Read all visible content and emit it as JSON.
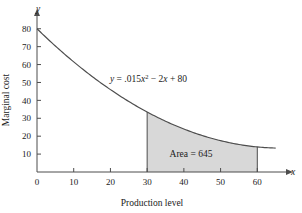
{
  "chart_data": {
    "type": "area",
    "title": "",
    "xlabel": "Production level",
    "ylabel": "Marginal cost",
    "x_axis_name": "x",
    "y_axis_name": "y",
    "xlim": [
      0,
      67
    ],
    "ylim": [
      0,
      86
    ],
    "xticks": [
      0,
      10,
      20,
      30,
      40,
      50,
      60
    ],
    "yticks": [
      10,
      20,
      30,
      40,
      50,
      60,
      70,
      80
    ],
    "xtick_labels": [
      "0",
      "10",
      "20",
      "30",
      "40",
      "50",
      "60"
    ],
    "ytick_labels": [
      "10",
      "20",
      "30",
      "40",
      "50",
      "60",
      "70",
      "80"
    ],
    "grid": false,
    "legend": "none",
    "curve": {
      "equation_label": "y = .015x² − 2x + 80",
      "equation_parts": {
        "lhs": "y",
        "equals": "=",
        "coefficient": ".015",
        "variable": "x",
        "exponent": "2",
        "linear_term": "− 2x",
        "constant": "+ 80"
      },
      "coef_quadratic": 0.015,
      "coef_linear": -2,
      "constant": 80,
      "x_start": 0,
      "x_end": 65,
      "points": [
        {
          "x": 0,
          "y": 80
        },
        {
          "x": 5,
          "y": 70.4
        },
        {
          "x": 10,
          "y": 61.5
        },
        {
          "x": 15,
          "y": 53.4
        },
        {
          "x": 20,
          "y": 46
        },
        {
          "x": 25,
          "y": 39.4
        },
        {
          "x": 30,
          "y": 33.5
        },
        {
          "x": 35,
          "y": 28.4
        },
        {
          "x": 40,
          "y": 24
        },
        {
          "x": 45,
          "y": 20.4
        },
        {
          "x": 50,
          "y": 17.5
        },
        {
          "x": 55,
          "y": 15.4
        },
        {
          "x": 60,
          "y": 14
        },
        {
          "x": 65,
          "y": 13.4
        }
      ]
    },
    "shaded_region": {
      "label": "Area = 645",
      "value": 645,
      "x_from": 30,
      "x_to": 60,
      "y_at_x_from": 33.5,
      "y_at_x_to": 14,
      "fill_color": "#d8d8d8",
      "label_parts": {
        "name": "Area",
        "equals": "=",
        "amount": "645"
      }
    },
    "colors": {
      "axis": "#4d4d4d",
      "curve": "#4d4d4d",
      "shading": "#d8d8d8",
      "text": "#1a1a1a",
      "background": "#ffffff"
    }
  }
}
